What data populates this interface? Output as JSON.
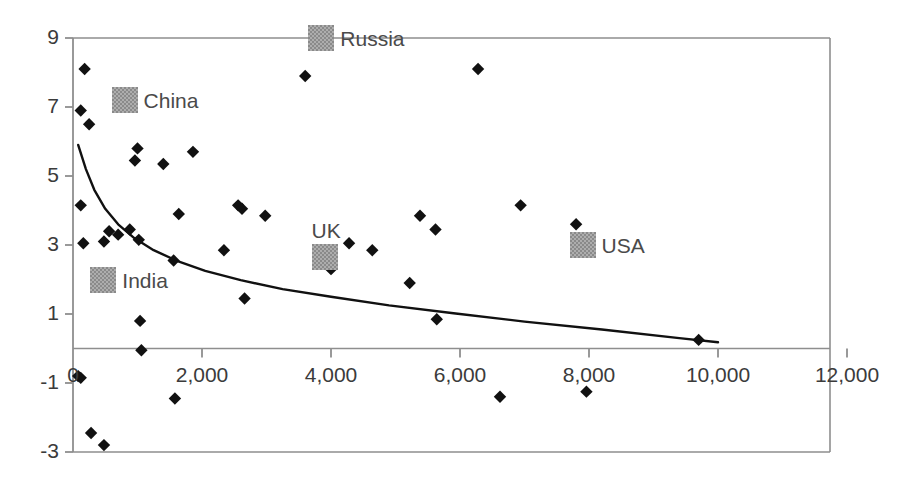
{
  "chart_data": {
    "type": "scatter",
    "title": "",
    "subtitle": "",
    "xlabel": "",
    "ylabel": "",
    "xlim": [
      0,
      12000
    ],
    "ylim": [
      -3,
      9
    ],
    "grid": false,
    "legend_position": "inline-annotations",
    "x_ticks": [
      {
        "value": 0,
        "label": "0"
      },
      {
        "value": 2000,
        "label": "2,000"
      },
      {
        "value": 4000,
        "label": "4,000"
      },
      {
        "value": 6000,
        "label": "6,000"
      },
      {
        "value": 8000,
        "label": "8,000"
      },
      {
        "value": 10000,
        "label": "10,000"
      },
      {
        "value": 12000,
        "label": "12,000"
      }
    ],
    "y_ticks": [
      {
        "value": 9,
        "label": "9"
      },
      {
        "value": 7,
        "label": "7"
      },
      {
        "value": 5,
        "label": "5"
      },
      {
        "value": 3,
        "label": "3"
      },
      {
        "value": 1,
        "label": "1"
      },
      {
        "value": -1,
        "label": "-1"
      },
      {
        "value": -3,
        "label": "-3"
      }
    ],
    "series": [
      {
        "name": "data-points",
        "marker": "diamond",
        "color": "#111111",
        "points": [
          {
            "x": 180,
            "y": 8.1
          },
          {
            "x": 120,
            "y": 6.9
          },
          {
            "x": 250,
            "y": 6.5
          },
          {
            "x": 1000,
            "y": 5.8
          },
          {
            "x": 960,
            "y": 5.45
          },
          {
            "x": 1400,
            "y": 5.35
          },
          {
            "x": 1860,
            "y": 5.7
          },
          {
            "x": 120,
            "y": 4.15
          },
          {
            "x": 1640,
            "y": 3.9
          },
          {
            "x": 2560,
            "y": 4.15
          },
          {
            "x": 2620,
            "y": 4.05
          },
          {
            "x": 2980,
            "y": 3.85
          },
          {
            "x": 160,
            "y": 3.05
          },
          {
            "x": 480,
            "y": 3.1
          },
          {
            "x": 560,
            "y": 3.4
          },
          {
            "x": 700,
            "y": 3.3
          },
          {
            "x": 880,
            "y": 3.45
          },
          {
            "x": 1020,
            "y": 3.15
          },
          {
            "x": 1560,
            "y": 2.55
          },
          {
            "x": 2340,
            "y": 2.85
          },
          {
            "x": 2660,
            "y": 1.45
          },
          {
            "x": 3600,
            "y": 7.9
          },
          {
            "x": 6280,
            "y": 8.1
          },
          {
            "x": 4280,
            "y": 3.05
          },
          {
            "x": 4640,
            "y": 2.85
          },
          {
            "x": 4000,
            "y": 2.3
          },
          {
            "x": 5220,
            "y": 1.9
          },
          {
            "x": 5640,
            "y": 0.85
          },
          {
            "x": 5380,
            "y": 3.85
          },
          {
            "x": 5620,
            "y": 3.45
          },
          {
            "x": 6940,
            "y": 4.15
          },
          {
            "x": 7800,
            "y": 3.6
          },
          {
            "x": 9700,
            "y": 0.25
          },
          {
            "x": 1040,
            "y": 0.8
          },
          {
            "x": 1060,
            "y": -0.05
          },
          {
            "x": 80,
            "y": -0.8
          },
          {
            "x": 120,
            "y": -0.85
          },
          {
            "x": 1580,
            "y": -1.45
          },
          {
            "x": 6620,
            "y": -1.4
          },
          {
            "x": 7960,
            "y": -1.25
          },
          {
            "x": 280,
            "y": -2.45
          },
          {
            "x": 480,
            "y": -2.8
          }
        ]
      },
      {
        "name": "trend-curve",
        "marker": "line",
        "color": "#111111",
        "points": [
          {
            "x": 80,
            "y": 5.9
          },
          {
            "x": 200,
            "y": 5.2
          },
          {
            "x": 330,
            "y": 4.6
          },
          {
            "x": 500,
            "y": 4.05
          },
          {
            "x": 700,
            "y": 3.6
          },
          {
            "x": 950,
            "y": 3.2
          },
          {
            "x": 1250,
            "y": 2.85
          },
          {
            "x": 1600,
            "y": 2.55
          },
          {
            "x": 2050,
            "y": 2.25
          },
          {
            "x": 2600,
            "y": 1.98
          },
          {
            "x": 3250,
            "y": 1.72
          },
          {
            "x": 4000,
            "y": 1.5
          },
          {
            "x": 4900,
            "y": 1.25
          },
          {
            "x": 5900,
            "y": 1.02
          },
          {
            "x": 7000,
            "y": 0.78
          },
          {
            "x": 8200,
            "y": 0.55
          },
          {
            "x": 9400,
            "y": 0.3
          },
          {
            "x": 10000,
            "y": 0.18
          }
        ]
      }
    ],
    "annotations": [
      {
        "label": "Russia",
        "x": 3850,
        "y": 9.0,
        "swatch": true,
        "swatch_color": "#8a8a8a",
        "label_side": "right"
      },
      {
        "label": "China",
        "x": 800,
        "y": 7.2,
        "swatch": true,
        "swatch_color": "#8a8a8a",
        "label_side": "right"
      },
      {
        "label": "USA",
        "x": 7900,
        "y": 3.0,
        "swatch": true,
        "swatch_color": "#8a8a8a",
        "label_side": "right"
      },
      {
        "label": "UK",
        "x": 3900,
        "y": 2.65,
        "swatch": true,
        "swatch_color": "#8a8a8a",
        "label_side": "above"
      },
      {
        "label": "India",
        "x": 470,
        "y": 2.0,
        "swatch": true,
        "swatch_color": "#8a8a8a",
        "label_side": "right"
      }
    ],
    "colors": {
      "marker": "#111111",
      "curve": "#111111",
      "axis": "#8e8e8e",
      "tick_text": "#3b3b3b",
      "annotation_text": "#4a4a4a",
      "swatch": "#8a8a8a",
      "background": "#ffffff"
    }
  }
}
